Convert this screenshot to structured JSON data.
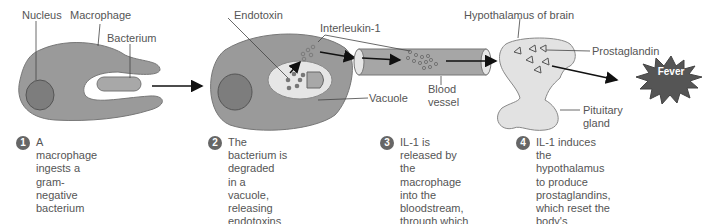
{
  "figure": {
    "panel1": {
      "labels": {
        "nucleus": "Nucleus",
        "macrophage": "Macrophage",
        "bacterium": "Bacterium"
      }
    },
    "panel2": {
      "labels": {
        "endotoxin": "Endotoxin",
        "interleukin": "Interleukin-1",
        "vacuole": "Vacuole",
        "blood_vessel": "Blood\nvessel"
      }
    },
    "panel3": {
      "labels": {
        "hypothalamus": "Hypothalamus of brain",
        "prostaglandin": "Prostaglandin",
        "pituitary": "Pituitary\ngland",
        "fever": "Fever"
      }
    },
    "colors": {
      "cell": "#9a9a9a",
      "nucleus": "#7d7d7d",
      "vacuole": "#e6e6e6",
      "brain": "#e2e2e2",
      "fever": "#555555",
      "arrow": "#111111",
      "badge": "#666666"
    },
    "steps": [
      {
        "num": "1",
        "text": "A macrophage ingests a\ngram-negative bacterium"
      },
      {
        "num": "2",
        "text": "The bacterium is degraded\nin a vacuole, releasing\nendotoxins that induce the\nmacrophage to produce\ninterleukin-1(IL-1)"
      },
      {
        "num": "3",
        "text": "IL-1 is released by\nthe macrophage\ninto the bloodstream,\nthrough which it travels\nto the hypothalamus\nof the brain"
      },
      {
        "num": "4",
        "text": "IL-1 induces the hypothalamus\nto produce prostaglandins,\nwhich reset the body's\n\"thermostat\" to a higher temp-\nerature, producing fever"
      }
    ]
  }
}
